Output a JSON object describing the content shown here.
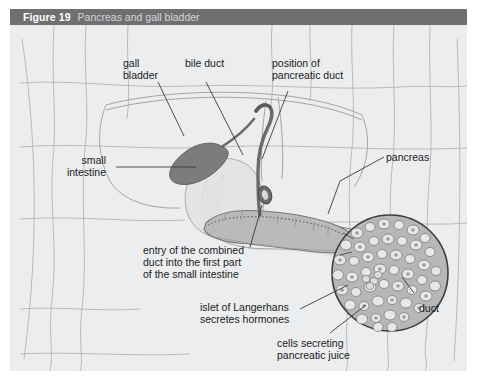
{
  "figure": {
    "number": "Figure 19",
    "title": "Pancreas and gall bladder",
    "header_bg": "#6e6f71",
    "panel_bg": "#ecedee"
  },
  "labels": {
    "gall_bladder": "gall\nbladder",
    "bile_duct": "bile duct",
    "position_of_pancreatic_duct": "position of\npancreatic duct",
    "small_intestine": "small\nintestine",
    "pancreas": "pancreas",
    "entry_of_combined_duct": "entry of the combined\nduct into the first part\nof the small intestine",
    "islet_of_langerhans": "islet of Langerhans\nsecretes hormones",
    "cells_secreting_pancreatic_juice": "cells secreting\npancreatic juice",
    "duct": "duct"
  },
  "colors": {
    "outline": "#8c8d8f",
    "leader": "#3a3a3a",
    "organ_dark": "#77787a",
    "organ_mid": "#a9aaac",
    "organ_light": "#d2d3d4",
    "inset_fill": "#b6b7b9",
    "cell_fill": "#e6e7e8",
    "text": "#1b1b1b"
  }
}
